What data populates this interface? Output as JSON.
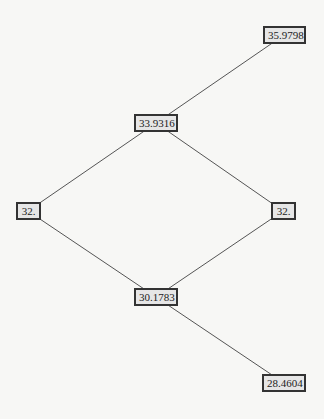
{
  "diagram": {
    "type": "lattice",
    "nodes": [
      {
        "id": "n1",
        "label": "35.9798",
        "x": 284,
        "y": 35
      },
      {
        "id": "n2",
        "label": "33.9316",
        "x": 156,
        "y": 123
      },
      {
        "id": "n3",
        "label": "32.",
        "x": 28,
        "y": 211
      },
      {
        "id": "n4",
        "label": "32.",
        "x": 283,
        "y": 211
      },
      {
        "id": "n5",
        "label": "30.1783",
        "x": 156,
        "y": 297
      },
      {
        "id": "n6",
        "label": "28.4604",
        "x": 284,
        "y": 383
      }
    ],
    "edges": [
      [
        "n1",
        "n2"
      ],
      [
        "n2",
        "n3"
      ],
      [
        "n2",
        "n4"
      ],
      [
        "n3",
        "n5"
      ],
      [
        "n4",
        "n5"
      ],
      [
        "n5",
        "n6"
      ]
    ]
  }
}
